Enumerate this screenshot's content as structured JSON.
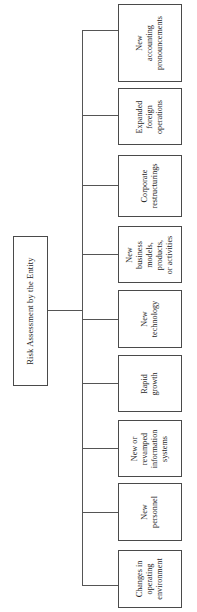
{
  "diagram": {
    "type": "tree",
    "orientation": "rotated-90-ccw",
    "root": {
      "label": "Risk Assessment by the Entity"
    },
    "children": [
      {
        "label": "New accounting pronouncements"
      },
      {
        "label": "Expanded foreign operations"
      },
      {
        "label": "Corporate restructurings"
      },
      {
        "label": "New business models, products, or activities"
      },
      {
        "label": "New technology"
      },
      {
        "label": "Rapid growth"
      },
      {
        "label": "New or revamped information systems"
      },
      {
        "label": "New personnel"
      },
      {
        "label": "Changes in operating environment"
      }
    ],
    "colors": {
      "background": "#ffffff",
      "box_border": "#4a4a4a",
      "line": "#555555",
      "text": "#1d1d1d"
    }
  }
}
